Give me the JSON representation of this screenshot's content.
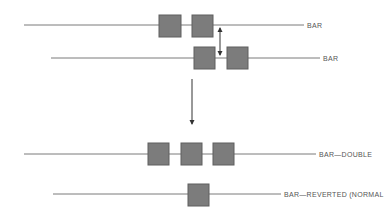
{
  "diagram": {
    "colors": {
      "line": "#7a7a7a",
      "box_fill": "#7c7c7c",
      "box_stroke": "#5e5e5e",
      "arrow": "#333333",
      "label": "#555555"
    },
    "rows": [
      {
        "id": "row-bar-1",
        "label": "BAR",
        "line": {
          "x1": 24,
          "x2": 304,
          "y": 25
        },
        "label_pos": {
          "x": 307,
          "y": 22
        },
        "boxes": [
          {
            "x": 159,
            "y": 15,
            "w": 22,
            "h": 22
          },
          {
            "x": 192,
            "y": 15,
            "w": 21,
            "h": 22
          }
        ]
      },
      {
        "id": "row-bar-2",
        "label": "BAR",
        "line": {
          "x1": 51,
          "x2": 320,
          "y": 58
        },
        "label_pos": {
          "x": 323,
          "y": 55
        },
        "boxes": [
          {
            "x": 194,
            "y": 47,
            "w": 21,
            "h": 22
          },
          {
            "x": 227,
            "y": 47,
            "w": 21,
            "h": 22
          }
        ]
      },
      {
        "id": "row-bar-double",
        "label": "BAR—DOUBLE",
        "line": {
          "x1": 24,
          "x2": 316,
          "y": 154
        },
        "label_pos": {
          "x": 319,
          "y": 151
        },
        "boxes": [
          {
            "x": 148,
            "y": 143,
            "w": 21,
            "h": 22
          },
          {
            "x": 181,
            "y": 143,
            "w": 21,
            "h": 22
          },
          {
            "x": 213,
            "y": 143,
            "w": 21,
            "h": 22
          }
        ]
      },
      {
        "id": "row-bar-reverted",
        "label": "BAR—REVERTED (NORMAL",
        "line": {
          "x1": 53,
          "x2": 281,
          "y": 194
        },
        "label_pos": {
          "x": 284,
          "y": 191
        },
        "boxes": [
          {
            "x": 188,
            "y": 184,
            "w": 21,
            "h": 22
          }
        ]
      }
    ],
    "arrows": [
      {
        "id": "shift-double-arrow",
        "type": "double",
        "x": 220,
        "y1": 28,
        "y2": 55
      },
      {
        "id": "transition-down-arrow",
        "type": "down",
        "x": 192,
        "y1": 79,
        "y2": 124
      }
    ]
  }
}
